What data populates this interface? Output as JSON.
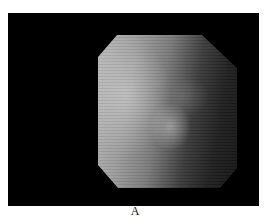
{
  "figure": {
    "panel_label": "A",
    "image_description": "Grayscale endoscopic image within an octagonal field of view on a black background",
    "colors": {
      "frame": "#000000",
      "background": "#ffffff"
    }
  }
}
